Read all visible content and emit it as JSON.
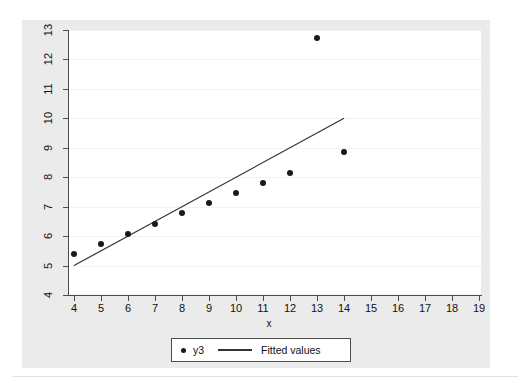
{
  "chart_data": {
    "type": "scatter",
    "title": "",
    "subtitle": "",
    "xlabel": "x",
    "ylabel": "",
    "xlim": [
      4,
      19
    ],
    "ylim": [
      4,
      13
    ],
    "xticks": [
      "4",
      "5",
      "6",
      "7",
      "8",
      "9",
      "10",
      "11",
      "12",
      "13",
      "14",
      "15",
      "16",
      "17",
      "18",
      "19"
    ],
    "yticks": [
      "4",
      "5",
      "6",
      "7",
      "8",
      "9",
      "10",
      "11",
      "12",
      "13"
    ],
    "grid": "horizontal-faint",
    "legend_position": "bottom-center",
    "series": [
      {
        "name": "y3",
        "type": "scatter",
        "marker": "filled-circle",
        "color": "#1a1a1a",
        "x": [
          4,
          5,
          6,
          7,
          8,
          9,
          10,
          11,
          12,
          13,
          14
        ],
        "values": [
          5.39,
          5.73,
          6.08,
          6.42,
          6.77,
          7.11,
          7.46,
          7.81,
          8.15,
          12.74,
          8.84
        ]
      },
      {
        "name": "Fitted values",
        "type": "line",
        "color": "#333333",
        "x": [
          4,
          14
        ],
        "values": [
          5.0,
          10.0
        ]
      }
    ]
  },
  "legend": {
    "entries": [
      {
        "label": "y3",
        "marker": "dot"
      },
      {
        "label": "Fitted values",
        "marker": "line"
      }
    ]
  },
  "axes": {
    "x_title": "x"
  },
  "colors": {
    "graph_background": "#ebebeb",
    "plot_background": "#ffffff",
    "axis": "#4d4d4d",
    "marker": "#1a1a1a",
    "fit_line": "#333333",
    "gridline": "#f2f2f2"
  }
}
